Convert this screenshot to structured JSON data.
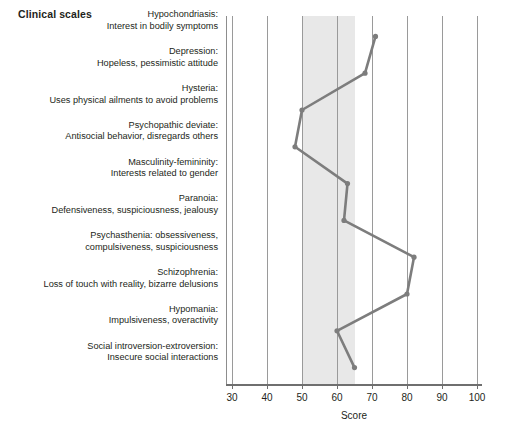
{
  "chart_title": "Clinical scales",
  "axis": {
    "xlabel": "Score",
    "ticks": [
      30,
      40,
      50,
      60,
      70,
      80,
      90,
      100
    ],
    "min": 28,
    "max": 101
  },
  "normal_band": {
    "label": "normal range band",
    "from": 50,
    "to": 65,
    "color": "#e8e8e8"
  },
  "series_color": "#7d7d7d",
  "scales": [
    {
      "name": "Hypochondriasis:",
      "description": "Interest in bodily symptoms",
      "score": 71
    },
    {
      "name": "Depression:",
      "description": "Hopeless, pessimistic attitude",
      "score": 68
    },
    {
      "name": "Hysteria:",
      "description": "Uses physical ailments to avoid problems",
      "score": 50
    },
    {
      "name": "Psychopathic deviate:",
      "description": "Antisocial behavior, disregards others",
      "score": 48
    },
    {
      "name": "Masculinity-femininity:",
      "description": "Interests related to gender",
      "score": 63
    },
    {
      "name": "Paranoia:",
      "description": "Defensiveness, suspiciousness, jealousy",
      "score": 62
    },
    {
      "name": "Psychasthenia: obsessiveness,",
      "description": "compulsiveness, suspiciousness",
      "score": 82
    },
    {
      "name": "Schizophrenia:",
      "description": "Loss of touch with reality, bizarre delusions",
      "score": 80
    },
    {
      "name": "Hypomania:",
      "description": "Impulsiveness, overactivity",
      "score": 60
    },
    {
      "name": "Social introversion-extroversion:",
      "description": "Insecure social interactions",
      "score": 65
    }
  ],
  "chart_data": {
    "type": "line",
    "title": "Clinical scales",
    "xlabel": "Score",
    "ylabel": "",
    "orientation": "horizontal",
    "grid": true,
    "legend_position": "none",
    "xlim": [
      28,
      101
    ],
    "xticks": [
      30,
      40,
      50,
      60,
      70,
      80,
      90,
      100
    ],
    "shaded_region": {
      "from": 50,
      "to": 65
    },
    "categories": [
      "Hypochondriasis: Interest in bodily symptoms",
      "Depression: Hopeless, pessimistic attitude",
      "Hysteria: Uses physical ailments to avoid problems",
      "Psychopathic deviate: Antisocial behavior, disregards others",
      "Masculinity-femininity: Interests related to gender",
      "Paranoia: Defensiveness, suspiciousness, jealousy",
      "Psychasthenia: obsessiveness, compulsiveness, suspiciousness",
      "Schizophrenia: Loss of touch with reality, bizarre delusions",
      "Hypomania: Impulsiveness, overactivity",
      "Social introversion-extroversion: Insecure social interactions"
    ],
    "values": [
      71,
      68,
      50,
      48,
      63,
      62,
      82,
      80,
      60,
      65
    ],
    "series": [
      {
        "name": "Profile",
        "values": [
          71,
          68,
          50,
          48,
          63,
          62,
          82,
          80,
          60,
          65
        ]
      }
    ]
  }
}
